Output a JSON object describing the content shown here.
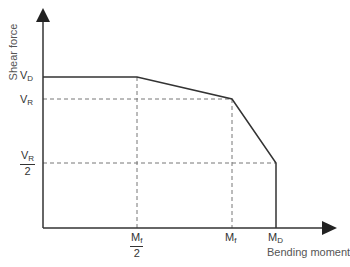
{
  "diagram": {
    "axes": {
      "y_label": "Shear force",
      "x_label": "Bending moment"
    },
    "y_ticks": [
      {
        "base": "V",
        "sub": "D"
      },
      {
        "base": "V",
        "sub": "R"
      },
      {
        "base": "V",
        "sub": "R",
        "denominator": "2"
      }
    ],
    "x_ticks": [
      {
        "base": "M",
        "sub": "f",
        "denominator": "2"
      },
      {
        "base": "M",
        "sub": "f"
      },
      {
        "base": "M",
        "sub": "D"
      }
    ],
    "curve_points": [
      {
        "x": "0",
        "y": "V_D"
      },
      {
        "x": "M_f/2",
        "y": "V_D"
      },
      {
        "x": "M_f",
        "y": "V_R"
      },
      {
        "x": "M_D",
        "y": "V_R/2"
      },
      {
        "x": "M_D",
        "y": "0"
      }
    ],
    "colors": {
      "line": "#333333",
      "dashed": "#777777"
    }
  }
}
